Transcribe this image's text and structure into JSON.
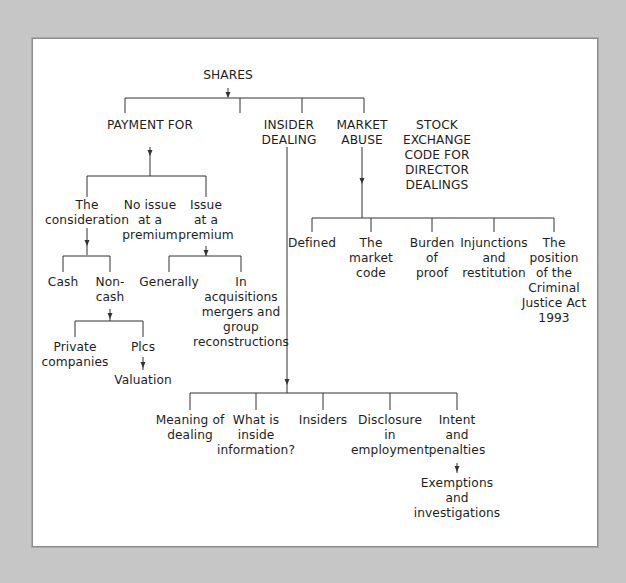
{
  "diagram": {
    "root": "SHARES",
    "branches": {
      "payment_for": {
        "label": "PAYMENT FOR",
        "children": {
          "the_consideration": {
            "label": "The\nconsideration",
            "children": {
              "cash": "Cash",
              "non_cash": "Non-\ncash"
            },
            "non_cash_children": {
              "private_companies": "Private\ncompanies",
              "plcs": "Plcs",
              "valuation": "Valuation"
            }
          },
          "no_issue_at_premium": "No issue\nat a\npremium",
          "issue_at_premium": {
            "label": "Issue\nat a\npremium",
            "children": {
              "generally": "Generally",
              "in_acquisitions": "In\nacquisitions\nmergers and\ngroup\nreconstructions"
            }
          }
        }
      },
      "insider_dealing": {
        "label": "INSIDER\nDEALING",
        "children": {
          "meaning_of_dealing": "Meaning of\ndealing",
          "what_is_inside_information": "What is\ninside\ninformation?",
          "insiders": "Insiders",
          "disclosure_in_employment": "Disclosure\nin\nemployment",
          "intent_and_penalties": "Intent\nand\npenalties",
          "exemptions_and_investigations": "Exemptions\nand\ninvestigations"
        }
      },
      "market_abuse": {
        "label": "MARKET\nABUSE",
        "children": {
          "defined": "Defined",
          "the_market_code": "The\nmarket\ncode",
          "burden_of_proof": "Burden\nof\nproof",
          "injunctions_and_restitution": "Injunctions\nand\nrestitution",
          "criminal_justice_act": "The\nposition\nof the\nCriminal\nJustice Act\n1993"
        }
      },
      "stock_exchange_code": {
        "label": "STOCK\nEXCHANGE\nCODE FOR\nDIRECTOR\nDEALINGS"
      }
    }
  }
}
